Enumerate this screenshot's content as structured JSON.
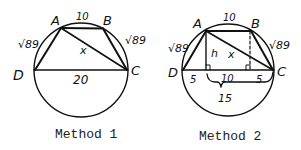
{
  "figures": [
    {
      "id": "method-1",
      "caption": "Method 1",
      "vertices": {
        "A": "A",
        "B": "B",
        "C": "C",
        "D": "D"
      },
      "labels": {
        "top": "10",
        "left": "√89",
        "right": "√89",
        "bottom": "20",
        "diagonal": "x"
      }
    },
    {
      "id": "method-2",
      "caption": "Method 2",
      "vertices": {
        "A": "A",
        "B": "B",
        "C": "C",
        "D": "D"
      },
      "labels": {
        "top": "10",
        "left": "√89",
        "right": "√89",
        "diagonal": "x",
        "height": "h",
        "seg_left": "5",
        "seg_mid": "10",
        "seg_right": "5",
        "brace": "15"
      }
    }
  ],
  "colors": {
    "ink": "#111111",
    "background": "#ffffff"
  }
}
